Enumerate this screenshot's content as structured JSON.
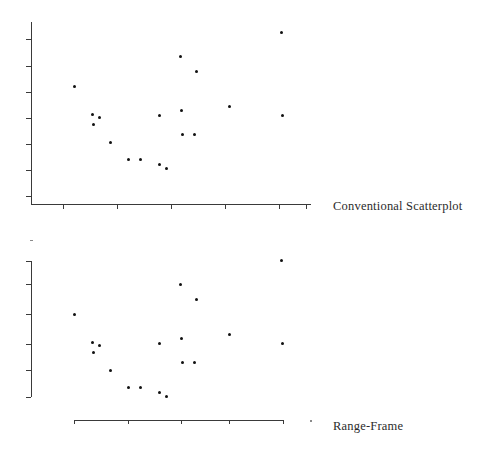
{
  "figure": {
    "title": "",
    "panels": [
      {
        "id": "conventional",
        "caption": "Conventional Scatterplot"
      },
      {
        "id": "range-frame",
        "caption": "Range-Frame"
      }
    ]
  },
  "chart_data": [
    {
      "type": "scatter",
      "title": "Conventional Scatterplot",
      "xlabel": "",
      "ylabel": "",
      "grid": false,
      "legend": null,
      "axis_style": "full-frame axes spanning the entire plotting region with evenly spaced tick marks, extending beyond the range of the data",
      "xlim": [
        0,
        10
      ],
      "ylim": [
        0,
        10
      ],
      "xticks": [
        1,
        3,
        5,
        7,
        9,
        10
      ],
      "yticks": [
        0,
        1.5,
        3,
        4.5,
        6,
        7.5,
        9
      ],
      "xticklabels": [],
      "yticklabels": [],
      "points": [
        {
          "x": 1.42,
          "y": 6.3
        },
        {
          "x": 2.08,
          "y": 4.68
        },
        {
          "x": 2.34,
          "y": 4.52
        },
        {
          "x": 2.12,
          "y": 4.12
        },
        {
          "x": 2.76,
          "y": 3.1
        },
        {
          "x": 3.42,
          "y": 2.12
        },
        {
          "x": 3.86,
          "y": 2.12
        },
        {
          "x": 4.58,
          "y": 1.82
        },
        {
          "x": 4.82,
          "y": 1.58
        },
        {
          "x": 4.56,
          "y": 4.62
        },
        {
          "x": 5.36,
          "y": 8.02
        },
        {
          "x": 5.38,
          "y": 4.92
        },
        {
          "x": 5.42,
          "y": 3.52
        },
        {
          "x": 5.86,
          "y": 3.52
        },
        {
          "x": 5.94,
          "y": 7.18
        },
        {
          "x": 7.16,
          "y": 5.14
        },
        {
          "x": 9.08,
          "y": 9.38
        },
        {
          "x": 9.14,
          "y": 4.62
        }
      ]
    },
    {
      "type": "scatter",
      "title": "Range-Frame",
      "xlabel": "",
      "ylabel": "",
      "grid": false,
      "legend": null,
      "axis_style": "range-frame: each axis line is truncated so it spans only the minimum-to-maximum extent of the plotted data, with ticks at quartile-like positions",
      "xlim": [
        0,
        10
      ],
      "ylim": [
        0,
        10
      ],
      "xticks": [
        1.42,
        3.42,
        5.36,
        7.16,
        9.14
      ],
      "yticks": [
        1.58,
        3.1,
        4.62,
        6.3,
        8.02,
        9.38
      ],
      "xticklabels": [],
      "yticklabels": [],
      "points": [
        {
          "x": 1.42,
          "y": 6.3
        },
        {
          "x": 2.08,
          "y": 4.68
        },
        {
          "x": 2.34,
          "y": 4.52
        },
        {
          "x": 2.12,
          "y": 4.12
        },
        {
          "x": 2.76,
          "y": 3.1
        },
        {
          "x": 3.42,
          "y": 2.12
        },
        {
          "x": 3.86,
          "y": 2.12
        },
        {
          "x": 4.58,
          "y": 1.82
        },
        {
          "x": 4.82,
          "y": 1.58
        },
        {
          "x": 4.56,
          "y": 4.62
        },
        {
          "x": 5.36,
          "y": 8.02
        },
        {
          "x": 5.38,
          "y": 4.92
        },
        {
          "x": 5.42,
          "y": 3.52
        },
        {
          "x": 5.86,
          "y": 3.52
        },
        {
          "x": 5.94,
          "y": 7.18
        },
        {
          "x": 7.16,
          "y": 5.14
        },
        {
          "x": 9.08,
          "y": 9.38
        },
        {
          "x": 9.14,
          "y": 4.62
        }
      ]
    }
  ],
  "colors": {
    "point": "#111111",
    "axis": "#3a3a3a",
    "text": "#2b2b2b",
    "background": "#ffffff"
  }
}
